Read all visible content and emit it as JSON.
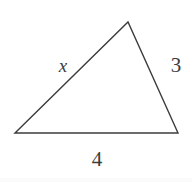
{
  "figure": {
    "type": "geometry-diagram",
    "shape": "triangle",
    "background_color": "#ffffff",
    "stroke_color": "#3c3c3c",
    "stroke_width": 1.4,
    "text_color": "#3c3c3c",
    "canvas": {
      "width": 192,
      "height": 182
    },
    "vertices": [
      {
        "name": "left-vertex",
        "x": 15,
        "y": 133
      },
      {
        "name": "apex-vertex",
        "x": 128,
        "y": 22
      },
      {
        "name": "right-vertex",
        "x": 178,
        "y": 133
      }
    ],
    "polygon_points": "15,133 128,22 178,133",
    "sides": [
      {
        "name": "left-side",
        "from": "left-vertex",
        "to": "apex-vertex",
        "label": "x",
        "label_style": "italic",
        "label_x": 62,
        "label_y": 67
      },
      {
        "name": "right-side",
        "from": "apex-vertex",
        "to": "right-vertex",
        "label": "3",
        "label_style": "normal",
        "label_x": 176,
        "label_y": 66
      },
      {
        "name": "bottom-side",
        "from": "left-vertex",
        "to": "right-vertex",
        "label": "4",
        "label_style": "normal",
        "label_x": 97,
        "label_y": 160
      }
    ]
  },
  "chart_data": {
    "type": "table",
    "title": "",
    "categories": [
      "left side",
      "right side",
      "bottom side"
    ],
    "values": [
      "x",
      "3",
      "4"
    ]
  }
}
